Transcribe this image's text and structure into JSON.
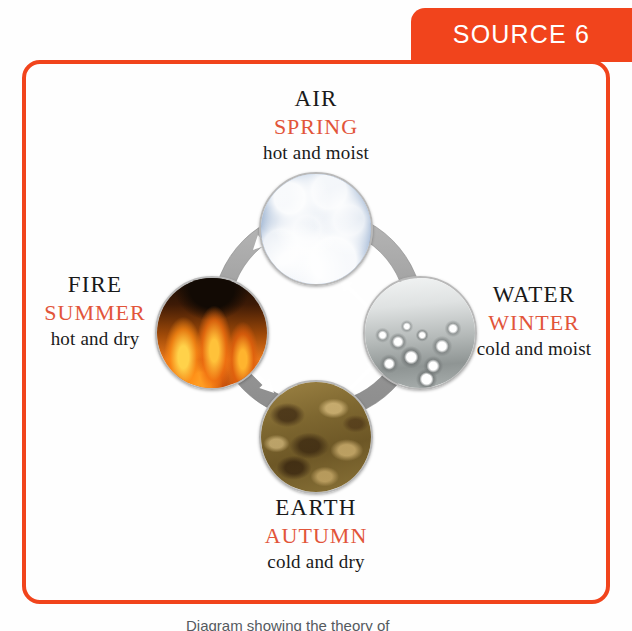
{
  "source_tab": {
    "label": "SOURCE 6",
    "background_color": "#F1441C",
    "text_color": "#FFFFFF"
  },
  "frame": {
    "border_color": "#F1441C"
  },
  "colors": {
    "accent_orange": "#F1441C",
    "season_text": "#E2553A",
    "body_text": "#1A1A1A",
    "ring_gray": "#9A9A9A",
    "arrow_white": "#FFFFFF"
  },
  "diagram": {
    "cycle_direction": "counter-clockwise",
    "ring": {
      "arrow_count": 4,
      "arrows": [
        {
          "name": "arrow-air-to-fire",
          "from": "AIR",
          "to": "FIRE"
        },
        {
          "name": "arrow-fire-to-earth",
          "from": "FIRE",
          "to": "EARTH"
        },
        {
          "name": "arrow-earth-to-water",
          "from": "EARTH",
          "to": "WATER"
        },
        {
          "name": "arrow-water-to-air",
          "from": "WATER",
          "to": "AIR"
        }
      ]
    },
    "nodes": [
      {
        "position": "top",
        "element": "AIR",
        "season": "SPRING",
        "quality": "hot and moist",
        "image": "sky-clouds-photo"
      },
      {
        "position": "left",
        "element": "FIRE",
        "season": "SUMMER",
        "quality": "hot and dry",
        "image": "flames-photo"
      },
      {
        "position": "right",
        "element": "WATER",
        "season": "WINTER",
        "quality": "cold and moist",
        "image": "water-droplets-photo"
      },
      {
        "position": "bottom",
        "element": "EARTH",
        "season": "AUTUMN",
        "quality": "cold and dry",
        "image": "soil-photo"
      }
    ]
  },
  "caption": {
    "text": "Diagram showing the theory of"
  }
}
